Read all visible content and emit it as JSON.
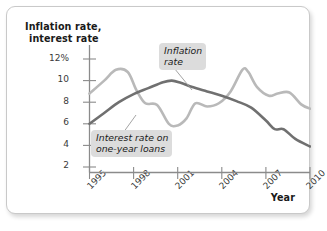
{
  "figure": {
    "frame_border_color": "#c9c9c9",
    "background": "#ffffff"
  },
  "axes": {
    "y_title_line1": "Inflation rate,",
    "y_title_line2": "interest rate",
    "x_title": "Year",
    "y_ticks": [
      "12%",
      "10",
      "8",
      "6",
      "4",
      "2"
    ],
    "x_ticks": [
      "1995",
      "1998",
      "2001",
      "2004",
      "2007",
      "2010"
    ]
  },
  "callouts": {
    "inflation_line1": "Inflation",
    "inflation_line2": "rate",
    "interest_line1": "Interest rate on",
    "interest_line2": "one-year loans"
  },
  "chart_data": {
    "type": "line",
    "title": "",
    "xlabel": "Year",
    "ylabel": "Inflation rate, interest rate",
    "xlim": [
      1995,
      2010
    ],
    "ylim": [
      0,
      12.6
    ],
    "ytick_values": [
      12,
      10,
      8,
      6,
      4,
      2
    ],
    "ytick_labels": [
      "12%",
      "10",
      "8",
      "6",
      "4",
      "2"
    ],
    "xtick_values": [
      1995,
      1998,
      2001,
      2004,
      2007,
      2010
    ],
    "xtick_labels": [
      "1995",
      "1998",
      "2001",
      "2004",
      "2007",
      "2010"
    ],
    "grid": false,
    "legend": "inline-callouts",
    "series": [
      {
        "name": "Inflation rate",
        "color": "#707070",
        "linewidth": 2.6,
        "x": [
          1995,
          1996,
          1997,
          1998,
          1999,
          2000,
          2000.6,
          2001.2,
          2002,
          2003,
          2004,
          2005,
          2006,
          2007,
          2007.6,
          2008.2,
          2009,
          2010
        ],
        "y": [
          6.0,
          7.0,
          8.0,
          8.75,
          9.3,
          9.85,
          10.0,
          9.8,
          9.4,
          9.0,
          8.6,
          8.1,
          7.5,
          6.3,
          5.5,
          5.5,
          4.6,
          3.9
        ]
      },
      {
        "name": "Interest rate on one-year loans",
        "color": "#b9b9b9",
        "linewidth": 2.6,
        "x": [
          1995,
          1996,
          1996.8,
          1997.6,
          1998.2,
          1998.8,
          1999.6,
          2000.4,
          2001,
          2001.6,
          2002.2,
          2003,
          2003.8,
          2004.6,
          2005.4,
          2005.8,
          2006.4,
          2007.2,
          2007.8,
          2008.6,
          2009.4,
          2010
        ],
        "y": [
          8.8,
          10.0,
          11.0,
          10.8,
          9.1,
          7.9,
          7.75,
          6.0,
          5.85,
          6.5,
          7.9,
          7.6,
          7.9,
          9.0,
          11.0,
          10.8,
          9.4,
          8.6,
          8.8,
          8.9,
          7.8,
          7.4
        ]
      }
    ]
  }
}
